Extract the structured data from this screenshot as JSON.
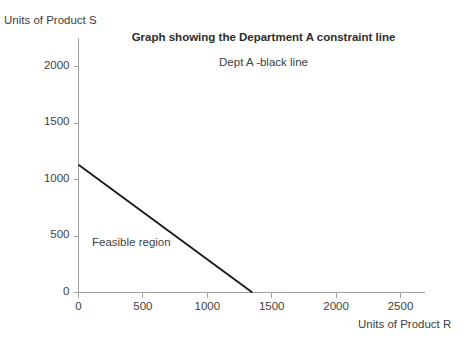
{
  "chart_data": {
    "type": "line",
    "title": "Graph showing the Department A constraint line",
    "subtitle": "Dept A -black line",
    "xlabel": "Units of Product R",
    "ylabel": "Units of Product S",
    "xlim": [
      0,
      2500
    ],
    "ylim": [
      0,
      2000
    ],
    "xticks": [
      0,
      500,
      1000,
      1500,
      2000,
      2500
    ],
    "yticks": [
      0,
      500,
      1000,
      1500,
      2000
    ],
    "xtick_labels": [
      "0",
      "500",
      "1000",
      "1500",
      "2000",
      "2500"
    ],
    "ytick_labels": [
      "0",
      "500",
      "1000",
      "1500",
      "2000"
    ],
    "grid": false,
    "legend": null,
    "series": [
      {
        "name": "Dept A constraint line",
        "color": "#1a1a1a",
        "x": [
          0,
          1350
        ],
        "y": [
          1130,
          0
        ]
      }
    ],
    "annotations": [
      {
        "name": "feasible-region",
        "text": "Feasible region",
        "x": 250,
        "y": 490
      }
    ],
    "axis_color": "#a0a0a0",
    "background": "#ffffff"
  }
}
